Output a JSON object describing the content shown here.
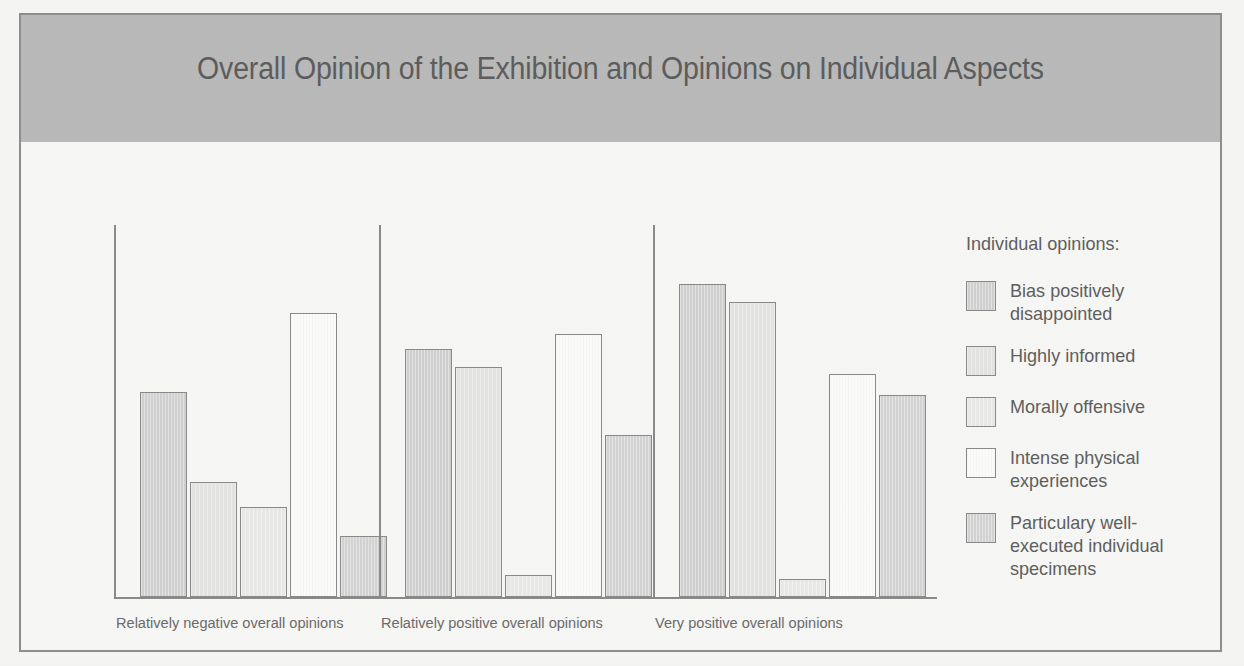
{
  "figure": {
    "title": "Overall Opinion of the Exhibition and Opinions on Individual Aspects"
  },
  "legend": {
    "title": "Individual opinions:",
    "items": [
      {
        "label": "Bias positively disappointed",
        "color": "#cfcfcf"
      },
      {
        "label": "Highly informed",
        "color": "#e3e3e1"
      },
      {
        "label": "Morally offensive",
        "color": "#e8e8e6"
      },
      {
        "label": "Intense physical experiences",
        "color": "#fbfbf9"
      },
      {
        "label": "Particulary well-executed individual specimens",
        "color": "#d2d2d2"
      }
    ]
  },
  "chart_data": {
    "type": "bar",
    "title": "Overall Opinion of the Exhibition and Opinions on Individual Aspects",
    "xlabel": "",
    "ylabel": "",
    "grid": false,
    "legend_position": "right",
    "ylim": [
      0,
      100
    ],
    "categories": [
      "Relatively negative overall opinions",
      "Relatively positive overall opinions",
      "Very positive overall opinions"
    ],
    "series": [
      {
        "name": "Bias positively disappointed",
        "color": "#cfcfcf",
        "values": [
          57,
          69,
          87
        ]
      },
      {
        "name": "Highly informed",
        "color": "#e3e3e1",
        "values": [
          32,
          64,
          82
        ]
      },
      {
        "name": "Morally offensive",
        "color": "#e8e8e6",
        "values": [
          25,
          6,
          5
        ]
      },
      {
        "name": "Intense physical experiences",
        "color": "#fbfbf9",
        "values": [
          79,
          73,
          62
        ]
      },
      {
        "name": "Particulary well-executed individual specimens",
        "color": "#d2d2d2",
        "values": [
          17,
          45,
          56
        ]
      }
    ]
  }
}
